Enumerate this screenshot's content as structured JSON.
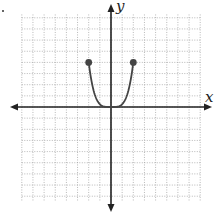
{
  "chart_data": {
    "type": "line",
    "title": "",
    "xlabel": "x",
    "ylabel": "y",
    "xlim": [
      -8,
      8
    ],
    "ylim": [
      -8.5,
      8.5
    ],
    "grid": true,
    "series": [
      {
        "name": "f(x)",
        "equation": "y = x^4/4",
        "domain": [
          -2,
          2
        ],
        "x": [
          -2,
          -1.5,
          -1,
          -0.5,
          0,
          0.5,
          1,
          1.5,
          2
        ],
        "y": [
          4,
          1.27,
          0.25,
          0.016,
          0,
          0.016,
          0.25,
          1.27,
          4
        ],
        "endpoints": [
          {
            "x": -2,
            "y": 4,
            "closed": true
          },
          {
            "x": 2,
            "y": 4,
            "closed": true
          }
        ]
      }
    ]
  },
  "axes": {
    "x_label": "x",
    "y_label": "y"
  },
  "colors": {
    "curve": "#444444",
    "axis": "#222222",
    "grid": "#9a9a9a"
  }
}
